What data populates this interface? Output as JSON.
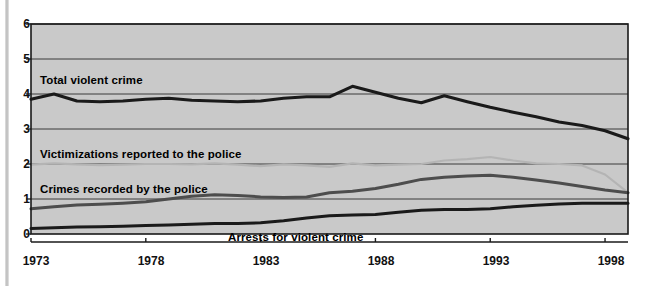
{
  "chart_data": {
    "type": "line",
    "title": "",
    "subtitle": "",
    "xlabel": "",
    "ylabel": "",
    "xlim": [
      1973,
      1999
    ],
    "ylim": [
      0,
      6
    ],
    "yticks": [
      0,
      1,
      2,
      3,
      4,
      5,
      6
    ],
    "ytick_labels": [
      "0",
      "1",
      "2",
      "3",
      "4",
      "5",
      "6"
    ],
    "xticks": [
      1973,
      1978,
      1983,
      1988,
      1993,
      1998
    ],
    "xtick_labels": [
      "1973",
      "1978",
      "1983",
      "1988",
      "1993",
      "1998"
    ],
    "grid": true,
    "grid_axis": "y",
    "legend": "inline-annotations",
    "plot_background": "#c9c9c9",
    "x": [
      1973,
      1974,
      1975,
      1976,
      1977,
      1978,
      1979,
      1980,
      1981,
      1982,
      1983,
      1984,
      1985,
      1986,
      1987,
      1988,
      1989,
      1990,
      1991,
      1992,
      1993,
      1994,
      1995,
      1996,
      1997,
      1998,
      1999
    ],
    "series": [
      {
        "name": "Total violent crime",
        "color": "#1a1a1a",
        "width": 3.1,
        "values": [
          3.85,
          4.0,
          3.8,
          3.78,
          3.8,
          3.85,
          3.88,
          3.82,
          3.8,
          3.78,
          3.8,
          3.88,
          3.92,
          3.92,
          4.22,
          4.05,
          3.88,
          3.75,
          3.95,
          3.78,
          3.62,
          3.48,
          3.35,
          3.2,
          3.1,
          2.95,
          2.72
        ]
      },
      {
        "name": "Victimizations reported to the police",
        "color": "#b4b4b4",
        "width": 2.2,
        "values": [
          1.98,
          2.02,
          1.99,
          1.97,
          1.98,
          2.0,
          2.0,
          1.99,
          2.02,
          1.98,
          1.94,
          1.99,
          1.96,
          1.92,
          2.02,
          1.96,
          1.98,
          2.0,
          2.1,
          2.14,
          2.2,
          2.1,
          2.02,
          2.0,
          1.96,
          1.7,
          1.18
        ]
      },
      {
        "name": "Crimes recorded by the police",
        "color": "#4d4d4d",
        "width": 3.0,
        "values": [
          0.72,
          0.78,
          0.83,
          0.85,
          0.88,
          0.92,
          1.0,
          1.08,
          1.12,
          1.1,
          1.06,
          1.04,
          1.06,
          1.18,
          1.22,
          1.3,
          1.42,
          1.56,
          1.62,
          1.66,
          1.68,
          1.62,
          1.54,
          1.46,
          1.36,
          1.26,
          1.18
        ]
      },
      {
        "name": "Arrests for violent crime",
        "color": "#1a1a1a",
        "width": 3.0,
        "values": [
          0.16,
          0.18,
          0.2,
          0.21,
          0.22,
          0.24,
          0.26,
          0.28,
          0.3,
          0.3,
          0.32,
          0.38,
          0.46,
          0.52,
          0.54,
          0.56,
          0.62,
          0.68,
          0.7,
          0.7,
          0.72,
          0.78,
          0.82,
          0.86,
          0.88,
          0.88,
          0.88
        ]
      }
    ],
    "annotations": [
      {
        "text": "Total violent crime",
        "x_px": 40,
        "y_px": 74,
        "align": "left"
      },
      {
        "text": "Victimizations reported to the police",
        "x_px": 40,
        "y_px": 148,
        "align": "left"
      },
      {
        "text": "Crimes recorded by the police",
        "x_px": 40,
        "y_px": 183,
        "align": "left"
      },
      {
        "text": "Arrests for violent crime",
        "x_px": 228,
        "y_px": 231,
        "align": "left"
      }
    ]
  },
  "axes": {
    "y_label_0": "0",
    "y_label_1": "1",
    "y_label_2": "2",
    "y_label_3": "3",
    "y_label_4": "4",
    "y_label_5": "5",
    "y_label_6": "6",
    "x_label_0": "1973",
    "x_label_1": "1978",
    "x_label_2": "1983",
    "x_label_3": "1988",
    "x_label_4": "1993",
    "x_label_5": "1998"
  },
  "labels": {
    "total_violent_crime": "Total violent crime",
    "victimizations_reported": "Victimizations reported to the police",
    "crimes_recorded": "Crimes recorded by the police",
    "arrests_for_violent_crime": "Arrests for violent crime"
  }
}
